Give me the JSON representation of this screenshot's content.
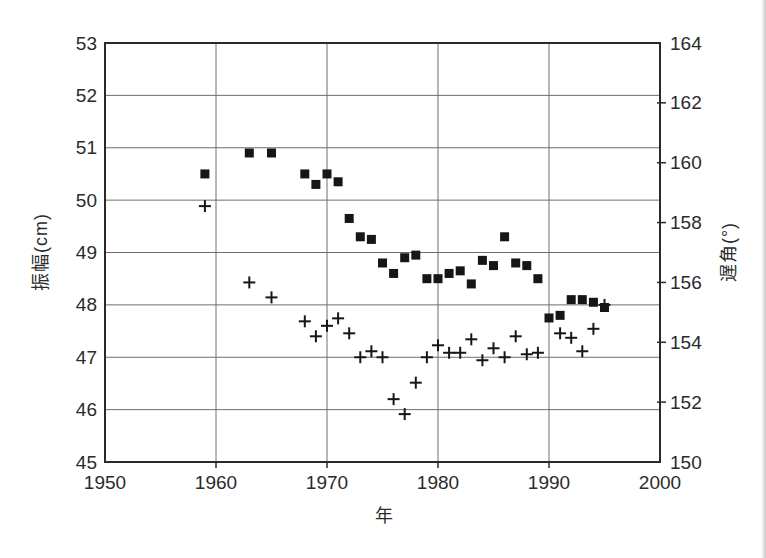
{
  "figure": {
    "background": "#ffffff",
    "frame_color": "#2a2a2a",
    "grid_color": "#6e6e6e",
    "point_color": "#161616",
    "text_color": "#2b2b2b"
  },
  "chart_data": {
    "type": "scatter",
    "title": "",
    "xlabel": "年",
    "ylabel_left": "振幅(cm)",
    "ylabel_right": "遅角(°)",
    "grid": true,
    "legend": "none",
    "x_range": [
      1950,
      2000
    ],
    "x_ticks": [
      1950,
      1960,
      1970,
      1980,
      1990,
      2000
    ],
    "y_left_range": [
      45,
      53
    ],
    "y_left_ticks": [
      53,
      52,
      51,
      50,
      49,
      48,
      47,
      46,
      45
    ],
    "y_right_range": [
      150,
      164
    ],
    "y_right_ticks": [
      164,
      162,
      160,
      158,
      156,
      154,
      152,
      150
    ],
    "series": [
      {
        "name": "振幅",
        "axis": "left",
        "marker": "square",
        "x": [
          1959,
          1963,
          1965,
          1968,
          1969,
          1970,
          1971,
          1972,
          1973,
          1974,
          1975,
          1976,
          1977,
          1978,
          1979,
          1980,
          1981,
          1982,
          1983,
          1984,
          1985,
          1986,
          1987,
          1988,
          1989,
          1990,
          1991,
          1992,
          1993,
          1994,
          1995
        ],
        "y": [
          50.5,
          50.9,
          50.9,
          50.5,
          50.3,
          50.5,
          50.35,
          49.65,
          49.3,
          49.25,
          48.8,
          48.6,
          48.9,
          48.95,
          48.5,
          48.5,
          48.6,
          48.65,
          48.4,
          48.85,
          48.75,
          49.3,
          48.8,
          48.75,
          48.5,
          47.75,
          47.8,
          48.1,
          48.1,
          48.05,
          47.95
        ]
      },
      {
        "name": "遅角",
        "axis": "right",
        "marker": "plus",
        "x": [
          1959,
          1963,
          1965,
          1968,
          1969,
          1970,
          1971,
          1972,
          1973,
          1974,
          1975,
          1976,
          1977,
          1978,
          1979,
          1980,
          1981,
          1982,
          1983,
          1984,
          1985,
          1986,
          1987,
          1988,
          1989,
          1991,
          1992,
          1993,
          1994,
          1995
        ],
        "y": [
          158.55,
          156.0,
          155.5,
          154.7,
          154.2,
          154.55,
          154.8,
          154.3,
          153.5,
          153.7,
          153.5,
          152.1,
          151.6,
          152.65,
          153.5,
          153.9,
          153.65,
          153.65,
          154.1,
          153.4,
          153.8,
          153.5,
          154.2,
          153.6,
          153.65,
          154.3,
          154.15,
          153.7,
          154.45,
          155.25
        ]
      }
    ]
  }
}
